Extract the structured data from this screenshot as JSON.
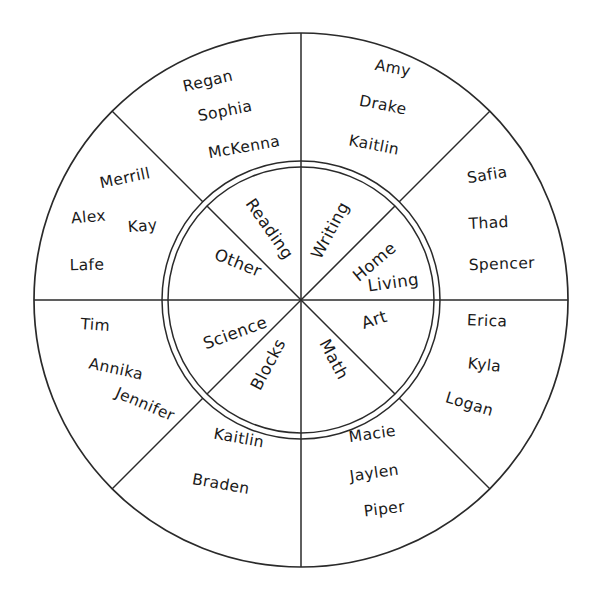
{
  "diagram": {
    "type": "center-choice-wheel",
    "geometry": {
      "center_x": 301,
      "center_y": 300,
      "outer_radius": 267,
      "inner_radius_outer_ring": 139,
      "inner_radius_inner_ring": 133,
      "sector_count": 8,
      "stroke_color": "#2a2a2a",
      "background_color": "#ffffff"
    },
    "sectors": [
      {
        "id": "reading",
        "center_label": "Reading",
        "angle_start_deg": -90,
        "angle_end_deg": -45,
        "names": [
          "Regan",
          "Sophia",
          "McKenna"
        ]
      },
      {
        "id": "writing",
        "center_label": "Writing",
        "angle_start_deg": -90,
        "angle_end_deg": -45,
        "names": [
          "Amy",
          "Drake",
          "Kaitlin"
        ]
      },
      {
        "id": "home-living",
        "center_label": "Home Living",
        "center_label_line1": "Home",
        "center_label_line2": "Living",
        "angle_start_deg": -45,
        "angle_end_deg": 0,
        "names": [
          "Safia",
          "Thad",
          "Spencer"
        ]
      },
      {
        "id": "art",
        "center_label": "Art",
        "angle_start_deg": 0,
        "angle_end_deg": 45,
        "names": [
          "Erica",
          "Kyla",
          "Logan"
        ]
      },
      {
        "id": "math",
        "center_label": "Math",
        "angle_start_deg": 45,
        "angle_end_deg": 90,
        "names": [
          "Macie",
          "Jaylen",
          "Piper"
        ]
      },
      {
        "id": "blocks",
        "center_label": "Blocks",
        "angle_start_deg": 90,
        "angle_end_deg": 135,
        "names": [
          "Kaitlin",
          "Braden"
        ]
      },
      {
        "id": "science",
        "center_label": "Science",
        "angle_start_deg": 135,
        "angle_end_deg": 180,
        "names": [
          "Tim",
          "Annika",
          "Jennifer"
        ]
      },
      {
        "id": "other",
        "center_label": "Other",
        "angle_start_deg": 180,
        "angle_end_deg": 225,
        "names": [
          "Merrill",
          "Alex",
          "Kay",
          "Lafe"
        ]
      }
    ],
    "center_labels": {
      "reading": "Reading",
      "writing": "Writing",
      "home": "Home",
      "living": "Living",
      "art": "Art",
      "math": "Math",
      "blocks": "Blocks",
      "science": "Science",
      "other": "Other"
    },
    "outer_names": {
      "reading_1": "Regan",
      "reading_2": "Sophia",
      "reading_3": "McKenna",
      "writing_1": "Amy",
      "writing_2": "Drake",
      "writing_3": "Kaitlin",
      "home_living_1": "Safia",
      "home_living_2": "Thad",
      "home_living_3": "Spencer",
      "art_1": "Erica",
      "art_2": "Kyla",
      "art_3": "Logan",
      "math_1": "Macie",
      "math_2": "Jaylen",
      "math_3": "Piper",
      "blocks_1": "Kaitlin",
      "blocks_2": "Braden",
      "science_1": "Tim",
      "science_2": "Annika",
      "science_3": "Jennifer",
      "other_1": "Merrill",
      "other_2": "Alex",
      "other_3": "Kay",
      "other_4": "Lafe"
    }
  }
}
